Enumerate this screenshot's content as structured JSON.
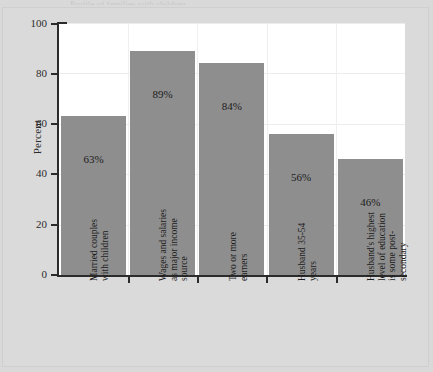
{
  "page": {
    "top_cut_caption": "Profile of families with children"
  },
  "chart_data": {
    "type": "bar",
    "title": "",
    "xlabel": "",
    "ylabel": "Percent",
    "ylim": [
      0,
      100
    ],
    "yticks": [
      0,
      20,
      40,
      60,
      80,
      100
    ],
    "grid": true,
    "legend": "none",
    "categories": [
      "Married couples\nwith children",
      "Wages and salaries\nas major income\nsource",
      "Two or more\nearners",
      "Husband 35-54\nyears",
      "Husband's highest\nlevel of education\nis some post-\nsecondary"
    ],
    "values": [
      63,
      89,
      84,
      56,
      46
    ],
    "value_labels": [
      "63%",
      "89%",
      "84%",
      "56%",
      "46%"
    ],
    "bar_color": "#8e8e8e",
    "plot_background": "#ffffff",
    "page_background": "#d9d9d9"
  }
}
